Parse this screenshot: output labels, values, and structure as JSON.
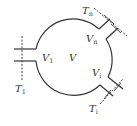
{
  "diagram": {
    "type": "control-volume",
    "colors": {
      "stroke": "#333333",
      "background": "#ffffff"
    },
    "volume": {
      "label": "V"
    },
    "ports": [
      {
        "id": "1",
        "inlet_label": "V",
        "inlet_sub": "1",
        "section_label": "T",
        "section_sub": "1"
      },
      {
        "id": "n",
        "inlet_label": "V",
        "inlet_sub": "n",
        "section_label": "T",
        "section_sub": "n"
      },
      {
        "id": "i",
        "inlet_label": "V",
        "inlet_sub": "i",
        "section_label": "T",
        "section_sub": "i"
      }
    ]
  }
}
